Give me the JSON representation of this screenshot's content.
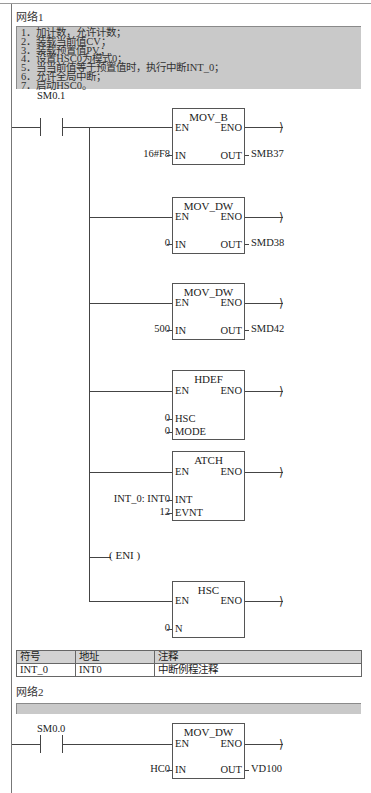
{
  "network1": {
    "label": "网络1",
    "comment_lines": [
      "1．加计数，允许计数；",
      "2．装载当前值CV；",
      "3．装载预置值PV；",
      "4．设置HSC0为模式0；",
      "5．当当前值等于预置值时，执行中断INT_0；",
      "6．允许全局中断；",
      "7．启动HSC0。"
    ],
    "contact": {
      "label": "SM0.1",
      "type": "normally-open"
    },
    "blocks": [
      {
        "title": "MOV_B",
        "en": "EN",
        "eno": "ENO",
        "inputs": [
          {
            "pin": "IN",
            "value": "16#F8"
          }
        ],
        "outputs": [
          {
            "pin": "OUT",
            "value": "SMB37"
          }
        ]
      },
      {
        "title": "MOV_DW",
        "en": "EN",
        "eno": "ENO",
        "inputs": [
          {
            "pin": "IN",
            "value": "0"
          }
        ],
        "outputs": [
          {
            "pin": "OUT",
            "value": "SMD38"
          }
        ]
      },
      {
        "title": "MOV_DW",
        "en": "EN",
        "eno": "ENO",
        "inputs": [
          {
            "pin": "IN",
            "value": "500"
          }
        ],
        "outputs": [
          {
            "pin": "OUT",
            "value": "SMD42"
          }
        ]
      },
      {
        "title": "HDEF",
        "en": "EN",
        "eno": "ENO",
        "inputs": [
          {
            "pin": "HSC",
            "value": "0"
          },
          {
            "pin": "MODE",
            "value": "0"
          }
        ],
        "outputs": []
      },
      {
        "title": "ATCH",
        "en": "EN",
        "eno": "ENO",
        "inputs": [
          {
            "pin": "INT",
            "value": "INT_0: INT0"
          },
          {
            "pin": "EVNT",
            "value": "12"
          }
        ],
        "outputs": []
      },
      {
        "title": "HSC",
        "en": "EN",
        "eno": "ENO",
        "inputs": [
          {
            "pin": "N",
            "value": "0"
          }
        ],
        "outputs": []
      }
    ],
    "coil": {
      "label": "ENI"
    }
  },
  "symbol_table": {
    "headers": [
      "符号",
      "地址",
      "注释"
    ],
    "rows": [
      [
        "INT_0",
        "INT0",
        "中断例程注释"
      ]
    ]
  },
  "network2": {
    "label": "网络2",
    "contact": {
      "label": "SM0.0",
      "type": "normally-open"
    },
    "block": {
      "title": "MOV_DW",
      "en": "EN",
      "eno": "ENO",
      "inputs": [
        {
          "pin": "IN",
          "value": "HC0"
        }
      ],
      "outputs": [
        {
          "pin": "OUT",
          "value": "VD100"
        }
      ]
    }
  },
  "colors": {
    "comment_bg": "#c9c9c9",
    "line": "#444444",
    "table_header_bg": "#d2d2d2"
  }
}
